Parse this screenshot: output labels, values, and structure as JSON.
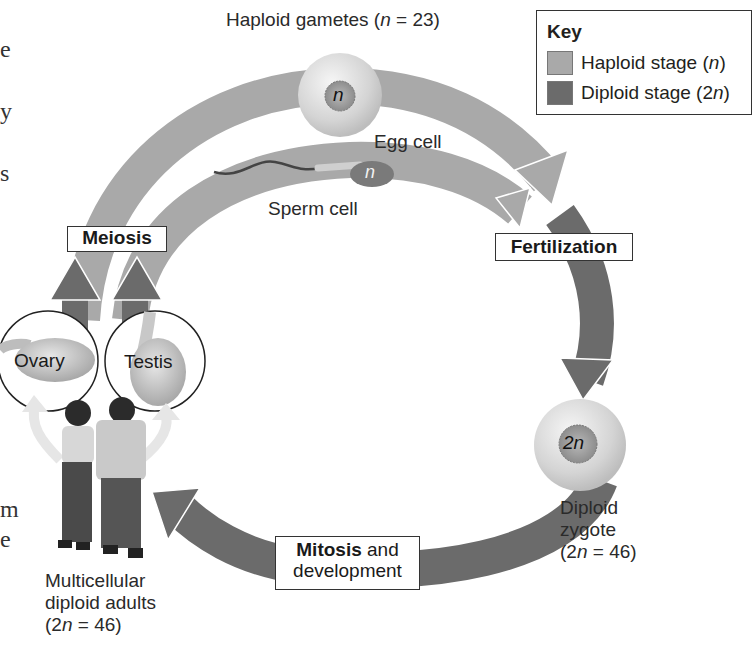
{
  "diagram": {
    "title_label": "Haploid gametes",
    "title_n_symbol": "n",
    "title_value": " = 23)",
    "colors": {
      "haploid": "#a9a9a9",
      "diploid": "#6b6b6b",
      "cell_fill": "#dcdcdc",
      "text": "#231f20",
      "box_border": "#333333"
    },
    "key": {
      "title": "Key",
      "items": [
        {
          "label": "Haploid stage (",
          "symbol": "n",
          "suffix": ")",
          "color": "#a9a9a9"
        },
        {
          "label": "Diploid stage (2",
          "symbol": "n",
          "suffix": ")",
          "color": "#6b6b6b"
        }
      ]
    },
    "cells": {
      "egg": {
        "label": "Egg cell",
        "nucleus": "n"
      },
      "sperm": {
        "label": "Sperm cell",
        "nucleus": "n"
      },
      "zygote": {
        "label_line1": "Diploid",
        "label_line2": "zygote",
        "label_line3_prefix": "(2",
        "label_line3_symbol": "n",
        "label_line3_suffix": " = 46)",
        "nucleus": "2n"
      }
    },
    "processes": {
      "meiosis": "Meiosis",
      "fertilization": "Fertilization",
      "mitosis_bold": "Mitosis",
      "mitosis_rest": " and",
      "mitosis_line2": "development"
    },
    "organs": {
      "ovary": "Ovary",
      "testis": "Testis"
    },
    "adults": {
      "line1": "Multicellular",
      "line2": "diploid adults",
      "line3_prefix": "(2",
      "line3_symbol": "n",
      "line3_suffix": " = 46)"
    },
    "cropped_margin_text": [
      "e",
      "y",
      "s",
      "m",
      "e"
    ]
  }
}
